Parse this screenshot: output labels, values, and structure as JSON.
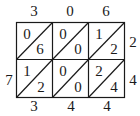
{
  "diagram": {
    "type": "lattice-multiplication",
    "multiplicand": "306",
    "multiplier": "24",
    "product": "7344",
    "top_digits": [
      "3",
      "0",
      "6"
    ],
    "right_digits": [
      "2",
      "4"
    ],
    "left_digits": [
      "",
      "7"
    ],
    "bottom_digits": [
      "3",
      "4",
      "4"
    ],
    "cells": [
      [
        {
          "tens": "0",
          "ones": "6"
        },
        {
          "tens": "0",
          "ones": "0"
        },
        {
          "tens": "1",
          "ones": "2"
        }
      ],
      [
        {
          "tens": "1",
          "ones": "2"
        },
        {
          "tens": "0",
          "ones": "0"
        },
        {
          "tens": "2",
          "ones": "4"
        }
      ]
    ]
  }
}
